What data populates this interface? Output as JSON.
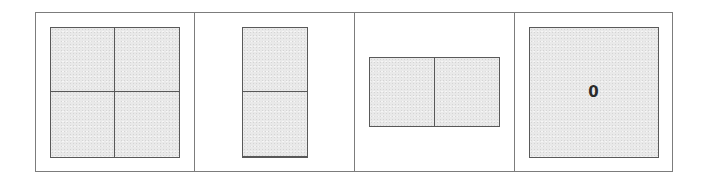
{
  "figure": {
    "background_color": "#ffffff",
    "frame": {
      "name": "outer-frame",
      "border_color": "#7c7c7c",
      "divider_color": "#7c7c7c"
    },
    "shape_style": {
      "fill_color": "#e9e9e9",
      "line_color": "#595959",
      "text_color": "#2b2b2b"
    },
    "panels": [
      {
        "index": 1,
        "shape": "square",
        "columns": 2,
        "rows": 2,
        "parts": 4,
        "label": "",
        "cells": [
          "",
          "",
          "",
          ""
        ]
      },
      {
        "index": 2,
        "shape": "tall-rectangle",
        "columns": 1,
        "rows": 2,
        "parts": 2,
        "label": "",
        "cells": [
          "",
          ""
        ]
      },
      {
        "index": 3,
        "shape": "wide-rectangle",
        "columns": 2,
        "rows": 1,
        "parts": 2,
        "label": "",
        "cells": [
          "",
          ""
        ]
      },
      {
        "index": 4,
        "shape": "square",
        "columns": 1,
        "rows": 1,
        "parts": 1,
        "label": "0",
        "cells": [
          ""
        ]
      }
    ]
  }
}
